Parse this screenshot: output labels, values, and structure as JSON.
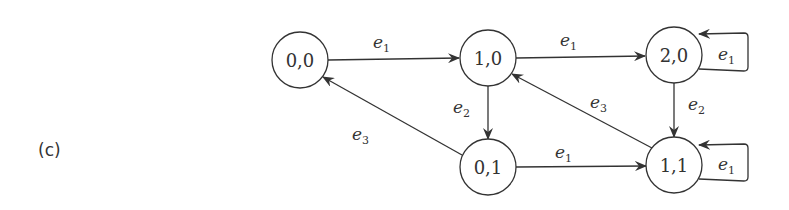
{
  "panel_label": "(c)",
  "nodes": [
    {
      "id": "n00",
      "label": "0,0",
      "cx": 300,
      "cy": 60
    },
    {
      "id": "n10",
      "label": "1,0",
      "cx": 488,
      "cy": 58
    },
    {
      "id": "n20",
      "label": "2,0",
      "cx": 674,
      "cy": 55
    },
    {
      "id": "n01",
      "label": "0,1",
      "cx": 488,
      "cy": 167
    },
    {
      "id": "n11",
      "label": "1,1",
      "cx": 674,
      "cy": 165
    }
  ],
  "edges": [
    {
      "from": "0,0",
      "to": "1,0",
      "label": "e",
      "sub": "1"
    },
    {
      "from": "1,0",
      "to": "2,0",
      "label": "e",
      "sub": "1"
    },
    {
      "from": "2,0",
      "to": "2,0",
      "label": "e",
      "sub": "1"
    },
    {
      "from": "1,0",
      "to": "0,1",
      "label": "e",
      "sub": "2"
    },
    {
      "from": "2,0",
      "to": "1,1",
      "label": "e",
      "sub": "2"
    },
    {
      "from": "0,1",
      "to": "0,0",
      "label": "e",
      "sub": "3"
    },
    {
      "from": "1,1",
      "to": "1,0",
      "label": "e",
      "sub": "3"
    },
    {
      "from": "0,1",
      "to": "1,1",
      "label": "e",
      "sub": "1"
    },
    {
      "from": "1,1",
      "to": "1,1",
      "label": "e",
      "sub": "1"
    }
  ]
}
